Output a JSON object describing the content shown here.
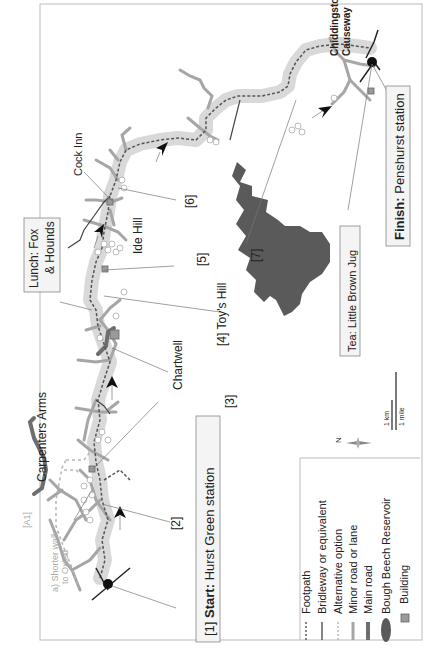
{
  "map": {
    "orientation": "rotated 90 degrees counter-clockwise",
    "start_label_prefix": "[1] ",
    "start_label_bold": "Start:",
    "start_label_rest": " Hurst Green station",
    "finish_label_bold": "Finish:",
    "finish_label_rest": " Penshurst station",
    "lunch_label_bold": "Lunch:",
    "lunch_label_line1": " Fox",
    "lunch_label_line2": "& Hounds",
    "tea_label_bold": "Tea:",
    "tea_label_rest": " Little Brown Jug",
    "waypoints": [
      {
        "id": "2",
        "label": "[2]"
      },
      {
        "id": "3",
        "label": "[3]"
      },
      {
        "id": "4",
        "label": "[4] Toy's Hill"
      },
      {
        "id": "5",
        "label": "[5]"
      },
      {
        "id": "6",
        "label": "[6]"
      },
      {
        "id": "7",
        "label": "[7]"
      }
    ],
    "places": {
      "carpenters_arms": "Carpenters Arms",
      "chartwell": "Chartwell",
      "ide_hill": "Ide Hill",
      "cock_inn": "Cock Inn",
      "chiddingstone_line1": "Chiddingstone",
      "chiddingstone_line2": "Causeway"
    },
    "road_label": "[A1]",
    "alt_note_line1": "a) Shorter walk",
    "alt_note_line2": "to Oxted",
    "compass_label": "N",
    "scale": {
      "km": "1 km",
      "mile": "1 mile"
    }
  },
  "legend": {
    "items": [
      {
        "symbol": "dotted-line",
        "label": "Footpath"
      },
      {
        "symbol": "solid-line",
        "label": "Bridleway or equivalent"
      },
      {
        "symbol": "light-dotted-line",
        "label": "Alternative option"
      },
      {
        "symbol": "light-thick-line",
        "label": "Minor road or lane"
      },
      {
        "symbol": "dark-thick-line",
        "label": "Main road"
      },
      {
        "symbol": "dark-ellipse",
        "label": "Bough Beech Reservoir"
      },
      {
        "symbol": "square",
        "label": "Building"
      }
    ]
  },
  "colors": {
    "route_halo": "#d9d9d9",
    "minor_road": "#a6a6a6",
    "main_road": "#6e6e6e",
    "reservoir": "#5a5a5a",
    "building": "#9a9a9a",
    "footpath": "#555555",
    "label_box": "#f4f4f4"
  }
}
